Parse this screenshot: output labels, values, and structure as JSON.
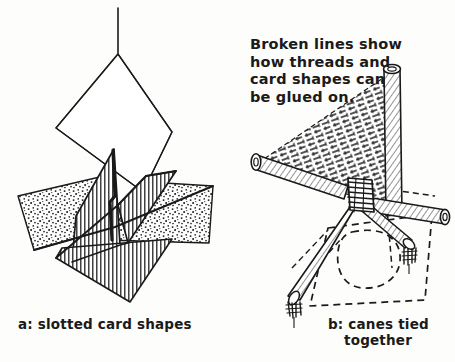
{
  "figure": {
    "background_color": "#fdfdfb",
    "ink_color": "#1a1a1a",
    "width": 455,
    "height": 362
  },
  "annotations": {
    "note": {
      "name": "broken-lines-note",
      "lines": [
        "Broken lines show",
        "how threads and",
        "card shapes can",
        "be glued on."
      ],
      "text": "Broken lines show\nhow threads and\ncard shapes can\nbe glued on."
    }
  },
  "captions": {
    "left": {
      "label": "a",
      "separator": ":",
      "text": "a: slotted card shapes"
    },
    "right": {
      "label": "b",
      "separator": ":",
      "line1": "b: canes tied",
      "line2": "together",
      "text": "b: canes tied together"
    }
  },
  "panels": [
    {
      "id": "panel-a",
      "name": "slotted-card-shapes-diagram",
      "caption": "a: slotted card shapes",
      "elements": [
        {
          "name": "hanging-thread",
          "style": "solid-line",
          "description": "vertical thread rising from the top vertex of the plain diamond"
        },
        {
          "name": "plain-diamond-card",
          "style": "outline-only",
          "fill": "none",
          "description": "large unshaded diamond card standing upright"
        },
        {
          "name": "stippled-card-left",
          "style": "stipple",
          "fill": "#ffffff",
          "description": "left-hand dotted (stippled) card shape"
        },
        {
          "name": "stippled-card-right",
          "style": "stipple",
          "fill": "#ffffff",
          "description": "right-hand dotted (stippled) card shape"
        },
        {
          "name": "hatched-card-upper",
          "style": "vertical-hatch",
          "description": "upper vertically hatched triangular card"
        },
        {
          "name": "hatched-card-right",
          "style": "vertical-hatch",
          "description": "right vertically hatched triangular card"
        },
        {
          "name": "hatched-card-lower",
          "style": "vertical-hatch",
          "description": "lower vertically hatched triangular card"
        },
        {
          "name": "slot-cut",
          "style": "slot",
          "description": "narrow slot cut where the cards interlock"
        }
      ]
    },
    {
      "id": "panel-b",
      "name": "canes-tied-together-diagram",
      "caption": "b: canes tied together",
      "elements": [
        {
          "name": "cane-upper-right",
          "style": "hollow-cane",
          "description": "cane rising to upper right with open ring end"
        },
        {
          "name": "cane-left",
          "style": "hollow-cane",
          "description": "cane going to the left with open ring end"
        },
        {
          "name": "cane-right",
          "style": "hollow-cane",
          "description": "cane going to the right with open ring end"
        },
        {
          "name": "cane-lower-left",
          "style": "hollow-cane",
          "description": "cane going down-left ending in a tassel"
        },
        {
          "name": "cane-lower-right",
          "style": "hollow-cane",
          "description": "cane going down-right ending in a tassel"
        },
        {
          "name": "binding-knot",
          "style": "thread-wrap",
          "description": "thread binding where all canes cross"
        },
        {
          "name": "thread-mesh",
          "style": "broken-lines",
          "description": "triangular mesh of broken thread lines between the upper and left canes"
        },
        {
          "name": "dashed-card-outline",
          "style": "broken-lines",
          "description": "broken-line quadrilateral showing where a card shape is glued on"
        },
        {
          "name": "dashed-inner-shape",
          "style": "broken-lines",
          "description": "broken-line rounded shape inside the card outline"
        },
        {
          "name": "tassel-lower-left",
          "style": "tassel",
          "description": "thread tassel at the lower-left cane tip"
        },
        {
          "name": "tassel-lower-right",
          "style": "tassel",
          "description": "thread tassel at the lower-right cane tip"
        }
      ]
    }
  ],
  "style_legend": {
    "broken_lines_meaning": "Broken lines show how threads and card shapes can be glued on.",
    "stipple_meaning": "dotted shading on card faces",
    "hatch_meaning": "vertical line shading on card faces"
  }
}
